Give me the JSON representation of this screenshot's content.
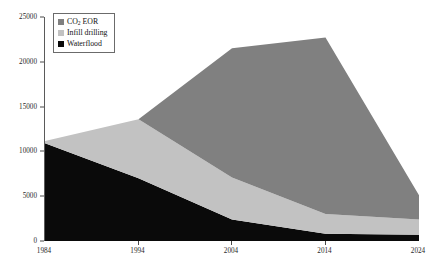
{
  "chart_data": {
    "type": "area",
    "stacked": true,
    "title": "",
    "xlabel": "",
    "ylabel": "Production (barrels/day)",
    "x": [
      1984,
      1994,
      2004,
      2014,
      2024
    ],
    "xtick_labels": [
      "1984",
      "1994",
      "2004",
      "2014",
      "2024"
    ],
    "ytick_labels": [
      "0",
      "5000",
      "10000",
      "15000",
      "20000",
      "25000"
    ],
    "yticks": [
      0,
      5000,
      10000,
      15000,
      20000,
      25000
    ],
    "xlim": [
      1984,
      2024
    ],
    "ylim": [
      0,
      25000
    ],
    "grid": false,
    "legend_position": "top-left",
    "series": [
      {
        "name": "Waterflood",
        "values": [
          10900,
          7000,
          2400,
          800,
          700
        ],
        "color": "#0a0a0a"
      },
      {
        "name": "Infill drilling",
        "values": [
          250,
          6600,
          4700,
          2200,
          1700
        ],
        "color": "#c2c2c2"
      },
      {
        "name": "CO2 EOR",
        "values": [
          0,
          0,
          14400,
          19700,
          2700
        ],
        "color": "#808080"
      }
    ],
    "totals": [
      11150,
      13600,
      21500,
      22700,
      5100
    ]
  },
  "legend": {
    "items": [
      {
        "label_html": "CO<sub>2</sub>  EOR",
        "label": "CO2 EOR",
        "swatch": "#808080"
      },
      {
        "label_html": "Infill drilling",
        "label": "Infill drilling",
        "swatch": "#c2c2c2"
      },
      {
        "label_html": "Waterflood",
        "label": "Waterflood",
        "swatch": "#0a0a0a"
      }
    ]
  },
  "axes": {
    "y_title": "Production (barrels/day)"
  }
}
